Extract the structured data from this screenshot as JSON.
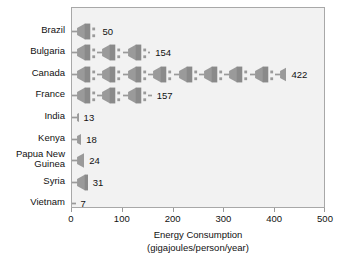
{
  "chart_data": {
    "type": "bar",
    "subtype": "pictograph",
    "title": "",
    "xlabel": "Energy Consumption",
    "xlabel_units": "(gigajoules/person/year)",
    "ylabel": "",
    "xlim": [
      0,
      500
    ],
    "xticks": [
      0,
      100,
      200,
      300,
      400,
      500
    ],
    "xtick_labels": [
      "0",
      "100",
      "200",
      "300",
      "400",
      "500"
    ],
    "grid": false,
    "legend": "none",
    "icon": "plug-icon",
    "icon_unit_value": 50,
    "categories": [
      "Brazil",
      "Bulgaria",
      "Canada",
      "France",
      "India",
      "Kenya",
      "Papua New\nGuinea",
      "Syria",
      "Vietnam"
    ],
    "values": [
      50,
      154,
      422,
      157,
      13,
      18,
      24,
      31,
      7
    ],
    "value_labels": [
      "50",
      "154",
      "422",
      "157",
      "13",
      "18",
      "24",
      "31",
      "7"
    ]
  },
  "colors": {
    "icon_fill": "#9a9a9a",
    "icon_shade": "#8a8a8a",
    "plot_background": "#f2f2f2",
    "plot_border": "#a8a8a8",
    "text": "#111111",
    "tick": "#9a9a9a",
    "page_background": "#ffffff"
  }
}
